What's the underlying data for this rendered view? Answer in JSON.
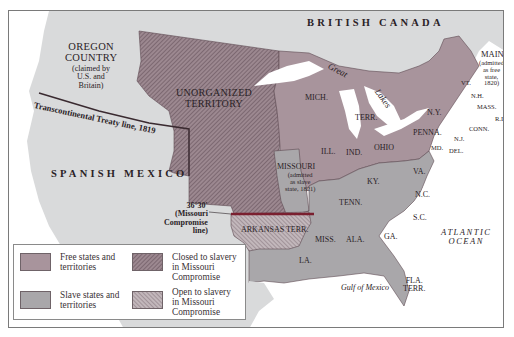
{
  "map": {
    "colors": {
      "free": "#a8949c",
      "slave": "#a9a7aa",
      "foreign_land": "#d9dadb",
      "water": "#ffffff",
      "closed_hatch_base": "#9c8890",
      "closed_hatch_line": "#6e5a63",
      "open_hatch_base": "#c2b7bb",
      "open_hatch_line": "#8b7a82",
      "compromise_line": "#7a1f2f",
      "treaty_line": "#3a2a30"
    },
    "regions": {
      "british_canada": "BRITISH CANADA",
      "oregon_title": "OREGON\nCOUNTRY",
      "oregon_note": "(claimed by\nU.S. and\nBritain)",
      "spanish_mexico": "SPANISH MEXICO",
      "unorganized_territory": "UNORGANIZED\nTERRITORY",
      "arkansas_terr": "ARKANSAS TERR.",
      "missouri_title": "MISSOURI",
      "missouri_note": "(admitted\nas slave\nstate, 1821)",
      "maine_title": "MAINE",
      "maine_note": "(admitted\nas free\nstate, 1820)"
    },
    "states": {
      "mich": "MICH.",
      "terr": "TERR.",
      "ill": "ILL.",
      "ind": "IND.",
      "ohio": "OHIO",
      "ny": "N.Y.",
      "penna": "PENNA.",
      "vt": "VT.",
      "nh": "N.H.",
      "mass": "MASS.",
      "ri": "R.I.",
      "conn": "CONN.",
      "nj": "N.J.",
      "md": "MD.",
      "del": "DEL.",
      "va": "VA.",
      "ky": "KY.",
      "nc": "N.C.",
      "tenn": "TENN.",
      "sc": "S.C.",
      "miss": "MISS.",
      "ala": "ALA.",
      "ga": "GA.",
      "la": "LA.",
      "fla": "FLA.\nTERR."
    },
    "water_labels": {
      "great_lakes_1": "Great",
      "great_lakes_2": "Lakes",
      "gulf": "Gulf of Mexico",
      "atlantic": "ATLANTIC\nOCEAN"
    },
    "lines": {
      "treaty": "Transcontinental Treaty line, 1819",
      "compromise": "36°30′\n(Missouri\nCompromise\nline)"
    }
  },
  "legend": {
    "items": [
      {
        "label": "Free states and\nterritories",
        "swatch": "free"
      },
      {
        "label": "Closed to slavery\nin Missouri\nCompromise",
        "swatch": "closed"
      },
      {
        "label": "Slave states and\nterritories",
        "swatch": "slave"
      },
      {
        "label": "Open to slavery\nin Missouri\nCompromise",
        "swatch": "open"
      }
    ]
  }
}
